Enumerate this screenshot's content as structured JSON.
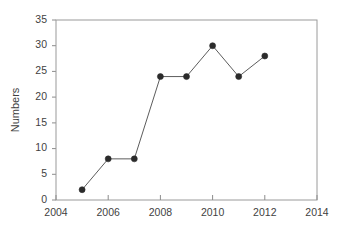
{
  "chart_data": {
    "type": "line",
    "title": "",
    "subtitle": "",
    "xlabel": "",
    "ylabel": "Numbers",
    "x": [
      2005,
      2006,
      2007,
      2008,
      2009,
      2010,
      2011,
      2012
    ],
    "values": [
      2,
      8,
      8,
      24,
      24,
      30,
      24,
      28
    ],
    "series": [
      {
        "name": "Numbers",
        "values": [
          2,
          8,
          8,
          24,
          24,
          30,
          24,
          28
        ]
      }
    ],
    "xlim": [
      2004,
      2014
    ],
    "ylim": [
      0,
      35
    ],
    "x_ticks": [
      2004,
      2006,
      2008,
      2010,
      2012,
      2014
    ],
    "x_tick_labels": [
      "2004",
      "2006",
      "2008",
      "2010",
      "2012",
      "2014"
    ],
    "y_ticks": [
      0,
      5,
      10,
      15,
      20,
      25,
      30,
      35
    ],
    "y_tick_labels": [
      "0",
      "5",
      "10",
      "15",
      "20",
      "25",
      "30",
      "35"
    ],
    "grid": false,
    "legend": false,
    "legend_position": "none",
    "marker": "filled-circle",
    "annotations": []
  },
  "style": {
    "line_color": "#5c5c5c",
    "marker_color": "#2b2b2b",
    "frame_color": "#9a9a9a",
    "text_color": "#3f3f3f",
    "background": "#ffffff"
  },
  "axis": {
    "y_title": "Numbers"
  }
}
